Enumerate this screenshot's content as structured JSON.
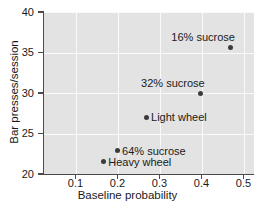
{
  "chart_data": {
    "type": "scatter",
    "title": "",
    "xlabel": "Baseline probability",
    "ylabel": "Bar presses/session",
    "xlim": [
      0.025,
      0.525
    ],
    "ylim": [
      20,
      40
    ],
    "xticks": [
      0.1,
      0.2,
      0.3,
      0.4,
      0.5
    ],
    "xticklabels": [
      "0.1",
      "0.2",
      "0.3",
      "0.4",
      "0.5"
    ],
    "yticks": [
      20,
      25,
      30,
      35,
      40
    ],
    "yticklabels": [
      "20",
      "25",
      "30",
      "35",
      "40"
    ],
    "grid": true,
    "grid_color": "#fafafa",
    "panel_color": "#e3e3e3",
    "marker_color": "#3b3b3b",
    "legend": "none",
    "points": [
      {
        "label": "16% sucrose",
        "x": 0.47,
        "y": 35.6,
        "label_pos": "above-left"
      },
      {
        "label": "32% sucrose",
        "x": 0.398,
        "y": 29.9,
        "label_pos": "above-left"
      },
      {
        "label": "Light wheel",
        "x": 0.268,
        "y": 27.0,
        "label_pos": "right"
      },
      {
        "label": "64% sucrose",
        "x": 0.199,
        "y": 22.9,
        "label_pos": "right"
      },
      {
        "label": "Heavy wheel",
        "x": 0.166,
        "y": 21.5,
        "label_pos": "right"
      }
    ]
  }
}
